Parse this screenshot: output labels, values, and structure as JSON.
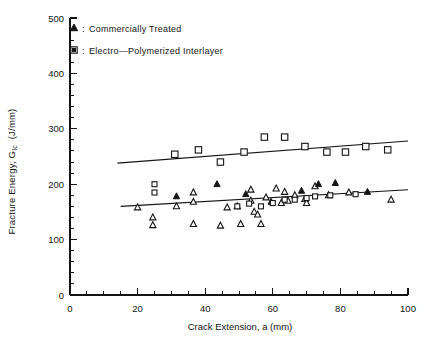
{
  "chart_data": {
    "type": "scatter",
    "title": "",
    "xlabel": "Crack Extension, a (mm)",
    "ylabel": "Fracture Energy, G_Ic (J/mm)",
    "ylabel_main": "Fracture Energy, G",
    "ylabel_sub": "Ic",
    "ylabel_units": "(J/mm)",
    "xlim": [
      0,
      100
    ],
    "ylim": [
      0,
      500
    ],
    "xticks": [
      0,
      20,
      40,
      60,
      80,
      100
    ],
    "yticks": [
      0,
      100,
      200,
      300,
      400,
      500
    ],
    "xtick_labels": [
      "0",
      "20",
      "40",
      "60",
      "80",
      "100"
    ],
    "ytick_labels": [
      "0",
      "100",
      "200",
      "300",
      "400",
      "500"
    ],
    "x_minor_step": 5,
    "y_minor_step": 20,
    "grid": false,
    "legend_position": "top-left-inside",
    "series": [
      {
        "name": "Commercially Treated",
        "marker": "triangle-filled",
        "legend_label": "Commercially Treated",
        "points": [
          [
            20.0,
            158
          ],
          [
            24.5,
            140
          ],
          [
            24.5,
            126
          ],
          [
            31.5,
            178
          ],
          [
            31.5,
            160
          ],
          [
            36.5,
            185
          ],
          [
            36.5,
            168
          ],
          [
            36.5,
            128
          ],
          [
            43.5,
            200
          ],
          [
            44.5,
            125
          ],
          [
            46.5,
            158
          ],
          [
            49.5,
            160
          ],
          [
            50.5,
            128
          ],
          [
            52.0,
            182
          ],
          [
            53.5,
            190
          ],
          [
            53.5,
            170
          ],
          [
            54.5,
            150
          ],
          [
            55.5,
            145
          ],
          [
            56.5,
            128
          ],
          [
            58.0,
            176
          ],
          [
            59.5,
            168
          ],
          [
            61.0,
            192
          ],
          [
            62.5,
            166
          ],
          [
            63.5,
            186
          ],
          [
            64.5,
            170
          ],
          [
            66.5,
            180
          ],
          [
            68.5,
            188
          ],
          [
            69.5,
            173
          ],
          [
            70.0,
            166
          ],
          [
            72.5,
            196
          ],
          [
            73.5,
            200
          ],
          [
            76.5,
            180
          ],
          [
            78.5,
            202
          ],
          [
            82.5,
            185
          ],
          [
            88.0,
            186
          ],
          [
            95.0,
            172
          ]
        ]
      },
      {
        "name": "Electro-Polymerized Interlayer",
        "marker": "square-open",
        "legend_label": "Electro—Polymerized Interlayer",
        "points": [
          [
            25.0,
            200
          ],
          [
            25.0,
            185
          ],
          [
            31.0,
            254
          ],
          [
            38.0,
            262
          ],
          [
            44.5,
            240
          ],
          [
            51.5,
            258
          ],
          [
            57.5,
            285
          ],
          [
            63.5,
            285
          ],
          [
            69.5,
            268
          ],
          [
            76.0,
            258
          ],
          [
            81.5,
            258
          ],
          [
            87.5,
            268
          ],
          [
            94.0,
            262
          ],
          [
            49.5,
            160
          ],
          [
            53.0,
            165
          ],
          [
            56.5,
            160
          ],
          [
            60.0,
            166
          ],
          [
            63.5,
            172
          ],
          [
            66.5,
            172
          ],
          [
            70.0,
            175
          ],
          [
            72.5,
            178
          ],
          [
            77.0,
            180
          ],
          [
            84.5,
            182
          ]
        ]
      }
    ],
    "fit_lines": [
      {
        "name": "Commercially Treated trend",
        "x1": 15.0,
        "y1": 160,
        "x2": 100.0,
        "y2": 190
      },
      {
        "name": "Electro-Polymerized Interlayer trend",
        "x1": 14.0,
        "y1": 238,
        "x2": 100.0,
        "y2": 278
      }
    ]
  },
  "legend": {
    "separator": ":",
    "entries": [
      {
        "marker": "triangle-filled",
        "label": "Commercially  Treated"
      },
      {
        "marker": "square-open",
        "label": "Electro—Polymerized  Interlayer"
      }
    ]
  },
  "axes": {
    "x_title": "Crack Extension, a (mm)",
    "y_title_main": "Fracture Energy, G",
    "y_title_sub": "Ic",
    "y_title_units": "(J/mm)"
  },
  "colors": {
    "ink": "#141414",
    "background": "#ffffff",
    "marker_fill_open": "#ffffff"
  }
}
